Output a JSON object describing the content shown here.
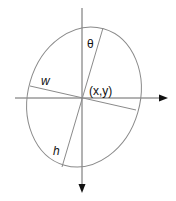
{
  "diagram": {
    "labels": {
      "theta": "θ",
      "width": "w",
      "height": "h",
      "center": "(x,y)"
    },
    "colors": {
      "stroke": "#8a8a8a",
      "axis": "#555555",
      "arrow": "#111111",
      "text": "#111111"
    },
    "geometry": {
      "center": [
        82,
        98
      ],
      "ellipse_rx": 57,
      "ellipse_ry": 71,
      "rotation_deg": 16
    }
  }
}
